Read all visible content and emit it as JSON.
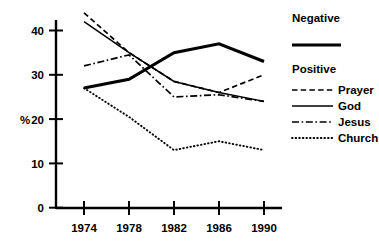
{
  "chart_data": {
    "type": "line",
    "title": "",
    "xlabel": "",
    "ylabel": "%",
    "x": [
      1974,
      1978,
      1982,
      1986,
      1990
    ],
    "categories": [
      "1974",
      "1978",
      "1982",
      "1986",
      "1990"
    ],
    "xlim": [
      1972,
      1992
    ],
    "ylim": [
      0,
      44
    ],
    "yticks": [
      0,
      10,
      20,
      30,
      40
    ],
    "ytick_labels": [
      "0",
      "10",
      "20",
      "30",
      "40"
    ],
    "xtick_labels": [
      "1974",
      "1978",
      "1982",
      "1986",
      "1990"
    ],
    "grid": false,
    "legend_position": "right",
    "series": [
      {
        "name": "Negative",
        "style": "solid-thick",
        "group": "Negative",
        "values": [
          27,
          29,
          35,
          37,
          33
        ]
      },
      {
        "name": "Prayer",
        "style": "dashed",
        "group": "Positive",
        "values": [
          44,
          35,
          28.5,
          26,
          30
        ]
      },
      {
        "name": "God",
        "style": "solid",
        "group": "Positive",
        "values": [
          42,
          35,
          28.5,
          26,
          24
        ]
      },
      {
        "name": "Jesus",
        "style": "dash-dot",
        "group": "Positive",
        "values": [
          32,
          34.5,
          25,
          25.5,
          24
        ]
      },
      {
        "name": "Church",
        "style": "dotted",
        "group": "Positive",
        "values": [
          27,
          20.5,
          13,
          15,
          13
        ]
      }
    ]
  },
  "axes": {
    "y_axis_title": "%",
    "y_tick_labels": [
      "40",
      "30",
      "20",
      "10",
      "0"
    ],
    "x_tick_labels": [
      "1974",
      "1978",
      "1982",
      "1986",
      "1990"
    ]
  },
  "legend": {
    "negative_heading": "Negative",
    "positive_heading": "Positive",
    "entries": [
      {
        "label": "Prayer"
      },
      {
        "label": "God"
      },
      {
        "label": "Jesus"
      },
      {
        "label": "Church"
      }
    ]
  }
}
